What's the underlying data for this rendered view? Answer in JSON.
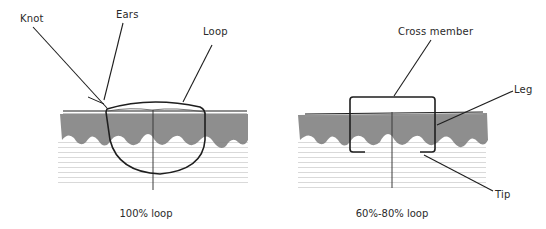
{
  "panels": [
    {
      "caption": "100% loop",
      "labels": {
        "knot": "Knot",
        "ears": "Ears",
        "loop": "Loop"
      }
    },
    {
      "caption": "60%-80% loop",
      "labels": {
        "cross_member": "Cross member",
        "leg": "Leg",
        "tip": "Tip"
      }
    }
  ],
  "colors": {
    "line": "#1e1e1e",
    "dermis_band": "#7a7a7a",
    "tissue_hatch": "#c8c8c8",
    "text": "#2a2a2a"
  }
}
